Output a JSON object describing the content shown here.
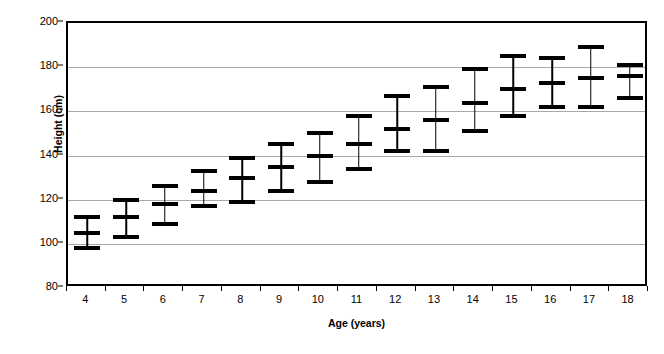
{
  "chart_data": {
    "type": "bar",
    "title": "",
    "xlabel": "Age (years)",
    "ylabel": "Height (cm)",
    "categories": [
      "4",
      "5",
      "6",
      "7",
      "8",
      "9",
      "10",
      "11",
      "12",
      "13",
      "14",
      "15",
      "16",
      "17",
      "18"
    ],
    "xlim": [
      3.5,
      18.5
    ],
    "ylim": [
      80,
      200
    ],
    "yticks": [
      80,
      100,
      120,
      140,
      160,
      180,
      200
    ],
    "ytick_labels": [
      "80",
      "100",
      "120",
      "140",
      "160",
      "180",
      "200"
    ],
    "grid": "horizontal",
    "legend": "none",
    "series": [
      {
        "name": "upper",
        "values": [
          112,
          120,
          126,
          133,
          139,
          145,
          150,
          158,
          167,
          171,
          179,
          185,
          184,
          189,
          181
        ]
      },
      {
        "name": "mean",
        "values": [
          105,
          112,
          118,
          124,
          130,
          135,
          140,
          145,
          152,
          156,
          164,
          170,
          173,
          175,
          176
        ]
      },
      {
        "name": "lower",
        "values": [
          98,
          103,
          109,
          117,
          119,
          124,
          128,
          134,
          142,
          142,
          151,
          158,
          162,
          162,
          166
        ]
      }
    ],
    "points": [
      {
        "age": "4",
        "lower": 98,
        "mean": 105,
        "upper": 112
      },
      {
        "age": "5",
        "lower": 103,
        "mean": 112,
        "upper": 120
      },
      {
        "age": "6",
        "lower": 109,
        "mean": 118,
        "upper": 126
      },
      {
        "age": "7",
        "lower": 117,
        "mean": 124,
        "upper": 133
      },
      {
        "age": "8",
        "lower": 119,
        "mean": 130,
        "upper": 139
      },
      {
        "age": "9",
        "lower": 124,
        "mean": 135,
        "upper": 145
      },
      {
        "age": "10",
        "lower": 128,
        "mean": 140,
        "upper": 150
      },
      {
        "age": "11",
        "lower": 134,
        "mean": 145,
        "upper": 158
      },
      {
        "age": "12",
        "lower": 142,
        "mean": 152,
        "upper": 167
      },
      {
        "age": "13",
        "lower": 142,
        "mean": 156,
        "upper": 171
      },
      {
        "age": "14",
        "lower": 151,
        "mean": 164,
        "upper": 179
      },
      {
        "age": "15",
        "lower": 158,
        "mean": 170,
        "upper": 185
      },
      {
        "age": "16",
        "lower": 162,
        "mean": 173,
        "upper": 184
      },
      {
        "age": "17",
        "lower": 162,
        "mean": 175,
        "upper": 189
      },
      {
        "age": "18",
        "lower": 166,
        "mean": 176,
        "upper": 181
      }
    ],
    "colors": {
      "marker": "#000000",
      "gridline": "#a9a9a9",
      "axis": "#000000",
      "background": "#ffffff"
    }
  }
}
